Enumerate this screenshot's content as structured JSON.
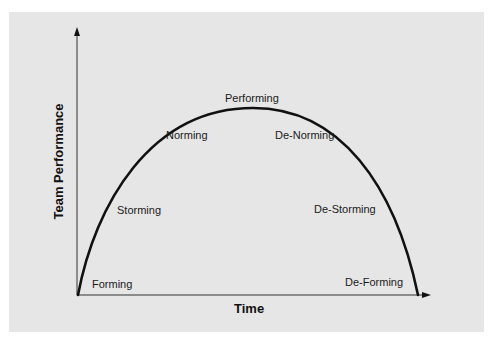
{
  "diagram": {
    "x_axis_label": "Time",
    "y_axis_label": "Team Performance",
    "colors": {
      "panel_background": "#e6e6e6",
      "page_background": "#ffffff",
      "curve": "#111111",
      "axis": "#333333",
      "text": "#1a1a1a"
    },
    "stages": [
      {
        "label": "Forming",
        "phase": "rising"
      },
      {
        "label": "Storming",
        "phase": "rising"
      },
      {
        "label": "Norming",
        "phase": "rising"
      },
      {
        "label": "Performing",
        "phase": "peak"
      },
      {
        "label": "De-Norming",
        "phase": "declining"
      },
      {
        "label": "De-Storming",
        "phase": "declining"
      },
      {
        "label": "De-Forming",
        "phase": "declining"
      }
    ]
  }
}
